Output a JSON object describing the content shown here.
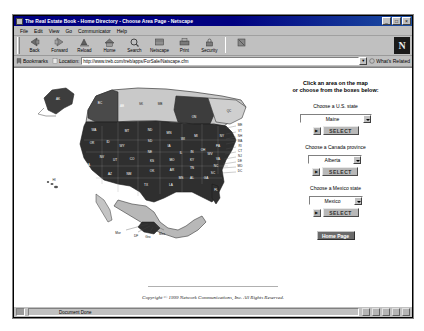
{
  "window": {
    "title": "The Real Estate Book - Home Directory - Choose Area Page - Netscape",
    "minimize_label": "_",
    "maximize_label": "□",
    "close_label": "×"
  },
  "menubar": {
    "items": [
      {
        "label": "File"
      },
      {
        "label": "Edit"
      },
      {
        "label": "View"
      },
      {
        "label": "Go"
      },
      {
        "label": "Communicator"
      },
      {
        "label": "Help"
      }
    ]
  },
  "toolbar": {
    "buttons": [
      {
        "label": "Back",
        "icon": "back-arrow-icon"
      },
      {
        "label": "Forward",
        "icon": "forward-arrow-icon"
      },
      {
        "label": "Reload",
        "icon": "reload-icon"
      },
      {
        "label": "Home",
        "icon": "home-icon"
      },
      {
        "label": "Search",
        "icon": "search-icon"
      },
      {
        "label": "Netscape",
        "icon": "netscape-icon"
      },
      {
        "label": "Print",
        "icon": "print-icon"
      },
      {
        "label": "Security",
        "icon": "lock-icon"
      }
    ],
    "stop_label": "Stop",
    "logo_letter": "N"
  },
  "locationbar": {
    "bookmarks_label": "Bookmarks",
    "location_label": "Location:",
    "url": "http://www.treb.com/treb/apps/ForSale/Natscape.cfm",
    "whats_related_label": "What's Related"
  },
  "page": {
    "heading_line1": "Click an area on the map",
    "heading_line2": "or choose from the boxes below:",
    "fields": [
      {
        "label": "Choose a U.S. state",
        "value": "Maine",
        "button_label": "SELECT",
        "go_icon": "go-arrow-icon"
      },
      {
        "label": "Choose a Canada province",
        "value": "Alberta",
        "button_label": "SELECT",
        "go_icon": "go-arrow-icon"
      },
      {
        "label": "Choose a Mexico state",
        "value": "Mexico",
        "button_label": "SELECT",
        "go_icon": "go-arrow-icon"
      }
    ],
    "home_button_label": "Home Page",
    "copyright": "Copyright © 1999 Network Communications, Inc. All Rights Reserved."
  },
  "map": {
    "canada_provinces": [
      {
        "code": "BC",
        "x": 74,
        "y": 30
      },
      {
        "code": "AB",
        "x": 96,
        "y": 33
      },
      {
        "code": "SK",
        "x": 115,
        "y": 31
      },
      {
        "code": "MB",
        "x": 134,
        "y": 31
      },
      {
        "code": "ON",
        "x": 168,
        "y": 44
      },
      {
        "code": "QC",
        "x": 203,
        "y": 38
      }
    ],
    "alaska": {
      "code": "AK",
      "x": 32,
      "y": 26
    },
    "hawaii": {
      "code": "HI",
      "x": 28,
      "y": 107
    },
    "us_states": [
      {
        "code": "WA",
        "x": 68,
        "y": 57
      },
      {
        "code": "OR",
        "x": 66,
        "y": 70
      },
      {
        "code": "ID",
        "x": 82,
        "y": 69
      },
      {
        "code": "MT",
        "x": 101,
        "y": 58
      },
      {
        "code": "ND",
        "x": 124,
        "y": 57
      },
      {
        "code": "MN",
        "x": 143,
        "y": 60
      },
      {
        "code": "WI",
        "x": 157,
        "y": 66
      },
      {
        "code": "MI",
        "x": 170,
        "y": 63
      },
      {
        "code": "WY",
        "x": 96,
        "y": 73
      },
      {
        "code": "SD",
        "x": 124,
        "y": 68
      },
      {
        "code": "NE",
        "x": 124,
        "y": 79
      },
      {
        "code": "IA",
        "x": 143,
        "y": 73
      },
      {
        "code": "IL",
        "x": 155,
        "y": 80
      },
      {
        "code": "IN",
        "x": 166,
        "y": 79
      },
      {
        "code": "OH",
        "x": 177,
        "y": 77
      },
      {
        "code": "PA",
        "x": 192,
        "y": 73
      },
      {
        "code": "NY",
        "x": 196,
        "y": 63
      },
      {
        "code": "CA",
        "x": 62,
        "y": 92
      },
      {
        "code": "NV",
        "x": 76,
        "y": 84
      },
      {
        "code": "UT",
        "x": 89,
        "y": 87
      },
      {
        "code": "CO",
        "x": 106,
        "y": 86
      },
      {
        "code": "KS",
        "x": 126,
        "y": 88
      },
      {
        "code": "MO",
        "x": 146,
        "y": 87
      },
      {
        "code": "KY",
        "x": 166,
        "y": 87
      },
      {
        "code": "WV",
        "x": 184,
        "y": 81
      },
      {
        "code": "VA",
        "x": 192,
        "y": 86
      },
      {
        "code": "AZ",
        "x": 84,
        "y": 101
      },
      {
        "code": "NM",
        "x": 103,
        "y": 101
      },
      {
        "code": "OK",
        "x": 126,
        "y": 98
      },
      {
        "code": "AR",
        "x": 146,
        "y": 97
      },
      {
        "code": "TN",
        "x": 166,
        "y": 95
      },
      {
        "code": "NC",
        "x": 190,
        "y": 93
      },
      {
        "code": "SC",
        "x": 187,
        "y": 100
      },
      {
        "code": "MS",
        "x": 155,
        "y": 105
      },
      {
        "code": "AL",
        "x": 166,
        "y": 105
      },
      {
        "code": "GA",
        "x": 180,
        "y": 105
      },
      {
        "code": "TX",
        "x": 120,
        "y": 112
      },
      {
        "code": "LA",
        "x": 145,
        "y": 112
      },
      {
        "code": "FL",
        "x": 190,
        "y": 117
      }
    ],
    "east_states": [
      {
        "code": "ME",
        "x": 214,
        "y": 52
      },
      {
        "code": "VT",
        "x": 214,
        "y": 58
      },
      {
        "code": "NH",
        "x": 214,
        "y": 63
      },
      {
        "code": "MA",
        "x": 214,
        "y": 68
      },
      {
        "code": "RI",
        "x": 214,
        "y": 73
      },
      {
        "code": "CT",
        "x": 214,
        "y": 78
      },
      {
        "code": "NJ",
        "x": 214,
        "y": 83
      },
      {
        "code": "DE",
        "x": 214,
        "y": 88
      },
      {
        "code": "MD",
        "x": 214,
        "y": 93
      },
      {
        "code": "DC",
        "x": 214,
        "y": 98
      }
    ],
    "mexico_labels": [
      {
        "code": "Mor",
        "x": 92,
        "y": 160
      },
      {
        "code": "DF",
        "x": 110,
        "y": 163
      },
      {
        "code": "Gro",
        "x": 122,
        "y": 164
      },
      {
        "code": "Mex",
        "x": 136,
        "y": 161
      }
    ]
  },
  "statusbar": {
    "text": "Document Done"
  }
}
